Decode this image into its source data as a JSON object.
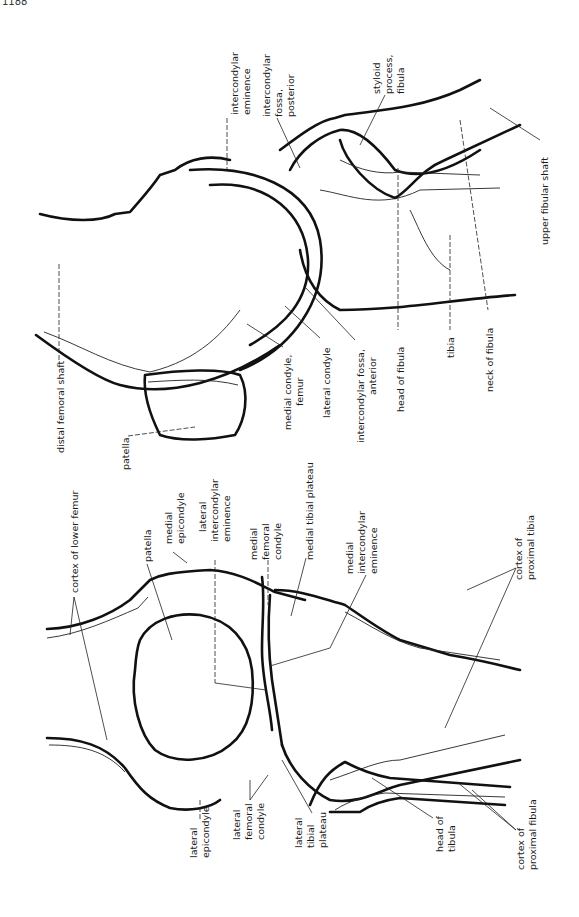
{
  "figure": {
    "corner_text": "1188",
    "orientation": "rotated 90° clockwise (labels read bottom-to-top)",
    "views": [
      {
        "name": "lateral view of knee",
        "labels": [
          {
            "id": "intercondylar-eminence",
            "lines": [
              "intercondylar",
              "eminence"
            ]
          },
          {
            "id": "intercondylar-fossa-posterior",
            "lines": [
              "intercondylar",
              "fossa,",
              "posterior"
            ]
          },
          {
            "id": "styloid-process-fibula",
            "lines": [
              "styloid",
              "process,",
              "fibula"
            ]
          },
          {
            "id": "upper-fibular-shaft",
            "lines": [
              "upper fibular shaft"
            ]
          },
          {
            "id": "distal-femoral-shaft",
            "lines": [
              "distal femoral shaft"
            ]
          },
          {
            "id": "patella-lateral",
            "lines": [
              "patella"
            ]
          },
          {
            "id": "medial-condyle-femur",
            "lines": [
              "medial condyle,",
              "femur"
            ]
          },
          {
            "id": "lateral-condyle",
            "lines": [
              "lateral condyle"
            ]
          },
          {
            "id": "intercondylar-fossa-anterior",
            "lines": [
              "intercondylar fossa,",
              "anterior"
            ]
          },
          {
            "id": "head-of-fibula-lateral",
            "lines": [
              "head of fibula"
            ]
          },
          {
            "id": "tibia",
            "lines": [
              "tibia"
            ]
          },
          {
            "id": "neck-of-fibula",
            "lines": [
              "neck of fibula"
            ]
          }
        ]
      },
      {
        "name": "anteroposterior view of knee",
        "labels": [
          {
            "id": "cortex-of-lower-femur",
            "lines": [
              "cortex of lower femur"
            ]
          },
          {
            "id": "patella-ap",
            "lines": [
              "patella"
            ]
          },
          {
            "id": "medial-epicondyle",
            "lines": [
              "medial",
              "epicondyle"
            ]
          },
          {
            "id": "lateral-intercondylar-eminence",
            "lines": [
              "lateral",
              "intercondylar",
              "eminence"
            ]
          },
          {
            "id": "medial-femoral-condyle",
            "lines": [
              "medial",
              "femoral",
              "condyle"
            ]
          },
          {
            "id": "medial-tibial-plateau",
            "lines": [
              "medial tibial plateau"
            ]
          },
          {
            "id": "medial-intercondylar-eminence",
            "lines": [
              "medial",
              "intercondylar",
              "eminence"
            ]
          },
          {
            "id": "cortex-of-proximal-tibia",
            "lines": [
              "cortex of",
              "proximal tibia"
            ]
          },
          {
            "id": "lateral-epicondyle",
            "lines": [
              "lateral",
              "epicondyle"
            ]
          },
          {
            "id": "lateral-femoral-condyle",
            "lines": [
              "lateral",
              "femoral",
              "condyle"
            ]
          },
          {
            "id": "lateral-tibial-plateau",
            "lines": [
              "lateral",
              "tibial",
              "plateau"
            ]
          },
          {
            "id": "head-of-tibula",
            "lines": [
              "head of",
              "tibula"
            ]
          },
          {
            "id": "cortex-of-proximal-fibula",
            "lines": [
              "cortex of",
              "proximal fibula"
            ]
          }
        ]
      }
    ]
  },
  "t": {
    "corner": "1188",
    "ie1": "intercondylar",
    "ie2": "eminence",
    "ifp1": "intercondylar",
    "ifp2": "fossa,",
    "ifp3": "posterior",
    "sp1": "styloid",
    "sp2": "process,",
    "sp3": "fibula",
    "ufs": "upper fibular shaft",
    "dfs": "distal femoral shaft",
    "pat1": "patella",
    "mcf1": "medial condyle,",
    "mcf2": "femur",
    "lc": "lateral condyle",
    "ifa1": "intercondylar fossa,",
    "ifa2": "anterior",
    "hof": "head of fibula",
    "tib": "tibia",
    "nof": "neck of fibula",
    "clf": "cortex of lower femur",
    "pat2": "patella",
    "me1": "medial",
    "me2": "epicondyle",
    "lie1": "lateral",
    "lie2": "intercondylar",
    "lie3": "eminence",
    "mfc1": "medial",
    "mfc2": "femoral",
    "mfc3": "condyle",
    "mtp": "medial tibial plateau",
    "mie1": "medial",
    "mie2": "intercondylar",
    "mie3": "eminence",
    "cpt1": "cortex of",
    "cpt2": "proximal tibia",
    "le1": "lateral",
    "le2": "epicondyle",
    "lfc1": "lateral",
    "lfc2": "femoral",
    "lfc3": "condyle",
    "ltp1": "lateral",
    "ltp2": "tibial",
    "ltp3": "plateau",
    "hot1": "head of",
    "hot2": "tibula",
    "cpf1": "cortex of",
    "cpf2": "proximal fibula"
  }
}
